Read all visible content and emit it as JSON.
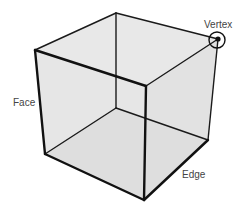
{
  "diagram": {
    "labels": {
      "vertex": "Vertex",
      "face": "Face",
      "edge": "Edge"
    },
    "colors": {
      "fill": "#e4e4e4",
      "stroke": "#111111",
      "text": "#444444"
    },
    "vertices": {
      "top_back": [
        116,
        13
      ],
      "top_right": [
        218,
        39
      ],
      "top_left": [
        35,
        50
      ],
      "top_front": [
        146,
        86
      ],
      "bottom_back": [
        116,
        108
      ],
      "bottom_right": [
        208,
        140
      ],
      "bottom_left": [
        45,
        154
      ],
      "bottom_front": [
        144,
        200
      ]
    },
    "highlighted_vertex": "top_right"
  }
}
